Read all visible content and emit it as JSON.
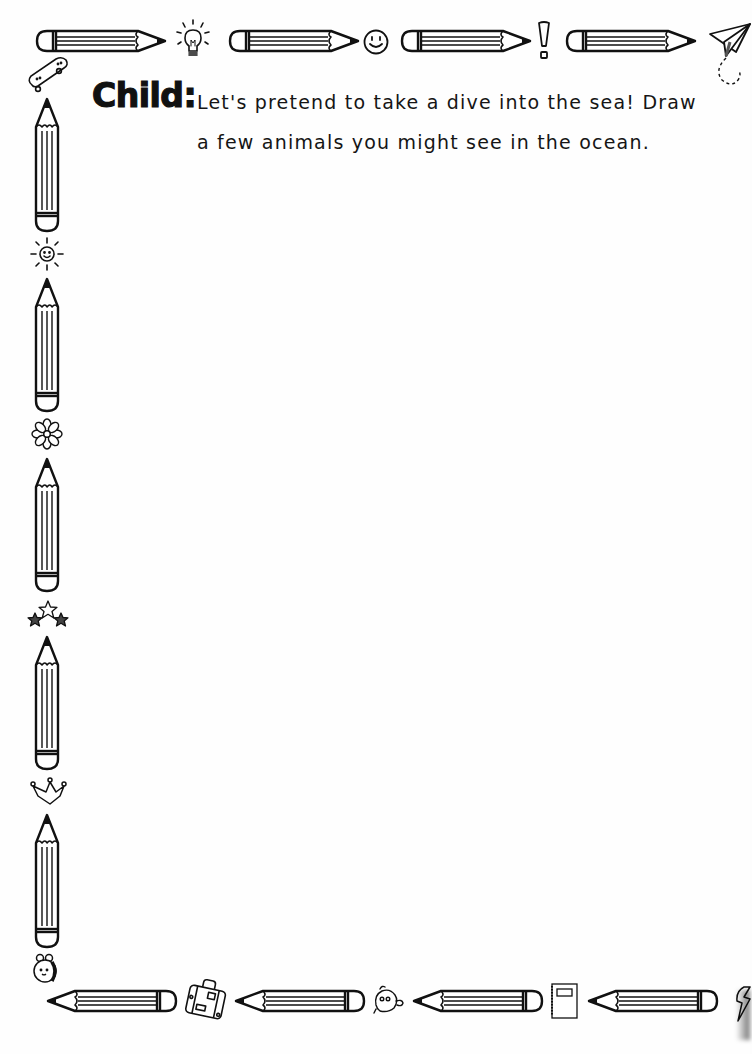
{
  "worksheet": {
    "label": "Child:",
    "prompt_lines": [
      "Let's pretend to take a dive into the sea! Draw",
      "a few animals you might see in the ocean."
    ],
    "drawing_area": ""
  },
  "border": {
    "top": {
      "pencils": [
        {
          "x": 35,
          "y": 30,
          "length": 132,
          "direction": "right"
        },
        {
          "x": 228,
          "y": 30,
          "length": 132,
          "direction": "right"
        },
        {
          "x": 400,
          "y": 30,
          "length": 131,
          "direction": "right"
        },
        {
          "x": 565,
          "y": 30,
          "length": 132,
          "direction": "right"
        }
      ],
      "icons": [
        "lightbulb-icon",
        "smiley-icon",
        "exclamation-icon",
        "paper-plane-icon"
      ]
    },
    "left": {
      "pencils": [
        {
          "x": 35,
          "y": 98,
          "length": 134,
          "direction": "up"
        },
        {
          "x": 35,
          "y": 278,
          "length": 134,
          "direction": "up"
        },
        {
          "x": 35,
          "y": 458,
          "length": 134,
          "direction": "up"
        },
        {
          "x": 35,
          "y": 636,
          "length": 134,
          "direction": "up"
        },
        {
          "x": 35,
          "y": 814,
          "length": 134,
          "direction": "up"
        }
      ],
      "icons": [
        "skateboard-icon",
        "sun-icon",
        "flower-icon",
        "stars-icon",
        "crown-icon",
        "bee-icon"
      ]
    },
    "bottom": {
      "pencils": [
        {
          "x": 45,
          "y": 990,
          "length": 130,
          "direction": "left"
        },
        {
          "x": 232,
          "y": 990,
          "length": 130,
          "direction": "left"
        },
        {
          "x": 410,
          "y": 990,
          "length": 130,
          "direction": "left"
        },
        {
          "x": 585,
          "y": 990,
          "length": 130,
          "direction": "left"
        }
      ],
      "icons": [
        "suitcase-icon",
        "chick-icon",
        "notebook-icon",
        "lightning-icon"
      ]
    }
  },
  "colors": {
    "ink": "#111111",
    "paper": "#fefefe"
  }
}
